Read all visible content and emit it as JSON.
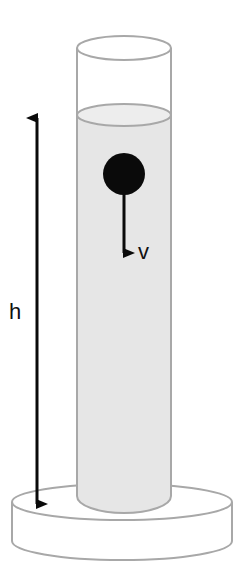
{
  "diagram": {
    "labels": {
      "height": "h",
      "velocity": "v"
    },
    "colors": {
      "outline": "#a8a8a8",
      "liquid": "#e6e6e6",
      "ball": "#0a0a0a",
      "arrow": "#0a0a0a",
      "background": "#ffffff"
    },
    "components": [
      "cylinder",
      "liquid",
      "ball",
      "velocity-arrow",
      "height-arrow",
      "base"
    ]
  }
}
